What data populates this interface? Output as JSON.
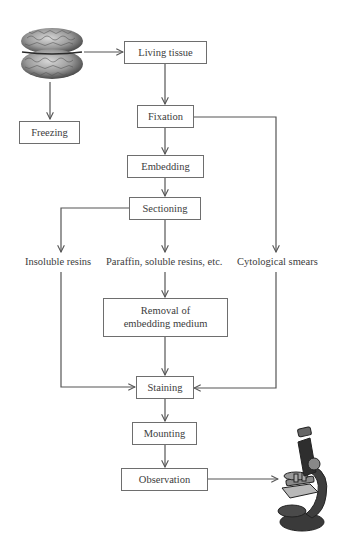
{
  "diagram": {
    "nodes": {
      "living_tissue": "Living tissue",
      "freezing": "Freezing",
      "fixation": "Fixation",
      "embedding": "Embedding",
      "sectioning": "Sectioning",
      "insoluble_resins": "Insoluble resins",
      "paraffin": "Paraffin, soluble resins, etc.",
      "cytological_smears": "Cytological smears",
      "removal_line1": "Removal of",
      "removal_line2": "embedding medium",
      "staining": "Staining",
      "mounting": "Mounting",
      "observation": "Observation"
    },
    "icons": {
      "brain": "brain-illustration",
      "microscope": "microscope-illustration"
    },
    "edges": [
      [
        "brain",
        "living_tissue"
      ],
      [
        "brain",
        "freezing"
      ],
      [
        "living_tissue",
        "fixation"
      ],
      [
        "fixation",
        "embedding"
      ],
      [
        "fixation",
        "cytological_smears"
      ],
      [
        "embedding",
        "sectioning"
      ],
      [
        "sectioning",
        "insoluble_resins"
      ],
      [
        "sectioning",
        "paraffin"
      ],
      [
        "paraffin",
        "removal"
      ],
      [
        "removal",
        "staining"
      ],
      [
        "insoluble_resins",
        "staining"
      ],
      [
        "cytological_smears",
        "staining"
      ],
      [
        "staining",
        "mounting"
      ],
      [
        "mounting",
        "observation"
      ],
      [
        "observation",
        "microscope"
      ]
    ],
    "colors": {
      "line": "#555555",
      "box_border": "#6e6e6e",
      "text": "#3c3c3c"
    }
  }
}
